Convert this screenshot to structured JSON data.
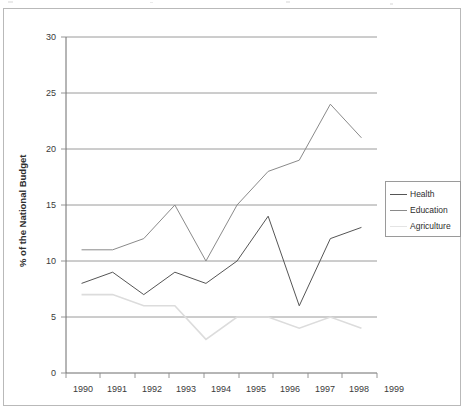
{
  "chart_data": {
    "type": "line",
    "title": "",
    "subtitle": "",
    "xlabel": "",
    "ylabel": "% of the National Budget",
    "x": [
      "1990",
      "1991",
      "1992",
      "1993",
      "1994",
      "1995",
      "1996",
      "1997",
      "1998",
      "1999"
    ],
    "categories": [
      "1990",
      "1991",
      "1992",
      "1993",
      "1994",
      "1995",
      "1996",
      "1997",
      "1998",
      "1999"
    ],
    "xtick_labels": [
      "1990",
      "1991",
      "1992",
      "1993",
      "1994",
      "1995",
      "1996",
      "1997",
      "1998",
      "1999"
    ],
    "ytick_labels": [
      "0",
      "5",
      "10",
      "15",
      "20",
      "25",
      "30"
    ],
    "yticks": [
      0,
      5,
      10,
      15,
      20,
      25,
      30
    ],
    "ylim": [
      0,
      30
    ],
    "grid": "horizontal",
    "legend_position": "right-outside",
    "series": [
      {
        "name": "Health",
        "color": "#555555",
        "values": [
          8,
          9,
          7,
          9,
          8,
          10,
          14,
          6,
          12,
          13
        ]
      },
      {
        "name": "Education",
        "color": "#8a8a8a",
        "values": [
          11,
          11,
          12,
          15,
          10,
          15,
          18,
          19,
          24,
          21
        ]
      },
      {
        "name": "Agriculture",
        "color": "#dcdcdc",
        "values": [
          7,
          7,
          6,
          6,
          3,
          5,
          5,
          4,
          5,
          4
        ]
      }
    ]
  },
  "legend": {
    "items": [
      {
        "label": "Health",
        "color": "#555555"
      },
      {
        "label": "Education",
        "color": "#8a8a8a"
      },
      {
        "label": "Agriculture",
        "color": "#e2e2e2"
      }
    ]
  },
  "axes": {
    "y_title": "% of the National Budget"
  }
}
